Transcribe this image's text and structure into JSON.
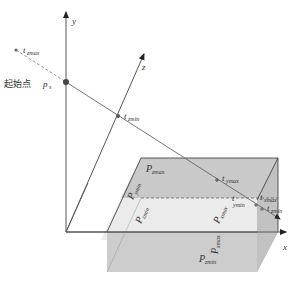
{
  "diagram": {
    "type": "ray-box intersection (slab method)",
    "axes": {
      "x": "x",
      "y": "y",
      "z": "z"
    },
    "start_point": {
      "label": "起始点",
      "symbol": "p",
      "subscript": "s"
    },
    "ray_parameters": [
      {
        "symbol": "t",
        "subscript": "zmax"
      },
      {
        "symbol": "t",
        "subscript": "zmin"
      },
      {
        "symbol": "t",
        "subscript": "ymax"
      },
      {
        "symbol": "t",
        "subscript": "ymin"
      },
      {
        "symbol": "t",
        "subscript": "xmax"
      },
      {
        "symbol": "t",
        "subscript": "zmin_end"
      }
    ],
    "planes": [
      {
        "symbol": "P",
        "subscript": "zmax"
      },
      {
        "symbol": "P",
        "subscript": "ymin"
      },
      {
        "symbol": "P",
        "subscript": "zmin"
      },
      {
        "symbol": "P",
        "subscript": "xmax"
      },
      {
        "symbol": "P",
        "subscript": "xmin"
      },
      {
        "symbol": "P",
        "subscript": "ymin_front"
      }
    ],
    "labels": {
      "t_zmax_sub": "zmax",
      "t_zmin_sub": "zmin",
      "t_ymax_sub": "ymax",
      "t_ymin_sub": "ymin",
      "t_xmax_sub": "xmax",
      "t_zmin2_sub": "zmin",
      "p_zmax_sub": "zmax",
      "p_ymin_sub": "ymin",
      "p_zmin_sub": "zmin",
      "p_xmax_sub": "xmax",
      "p_xmin_sub": "xmin",
      "p_ymin2_sub": "ymin",
      "p_xmax2_sub": "xmax",
      "p_min_sub": "zmin",
      "t": "t",
      "P": "P",
      "p": "p",
      "s": "s",
      "x": "x",
      "y": "y",
      "z": "z"
    },
    "colors": {
      "axis": "#555555",
      "ray": "#666666",
      "point": "#444444",
      "box_top": "#e6e6e6",
      "box_back": "#c8c8c8",
      "box_front": "#cfcfcf",
      "box_side": "#bdbdbd",
      "edge": "#333333"
    }
  }
}
